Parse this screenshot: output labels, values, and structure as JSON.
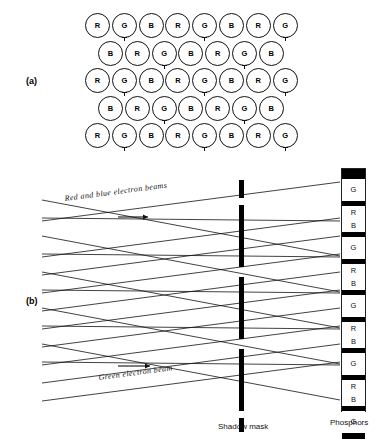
{
  "figure": {
    "part_a_label": "(a)",
    "part_b_label": "(b)"
  },
  "part_a": {
    "name": "phosphor-dot-triad-pattern",
    "row_count": 5,
    "rows": [
      {
        "offset": 0,
        "cells": [
          "R",
          "G",
          "B",
          "R",
          "G",
          "B",
          "R",
          "G"
        ],
        "marks": [
          1,
          4,
          7
        ]
      },
      {
        "offset": 13,
        "cells": [
          "B",
          "R",
          "G",
          "B",
          "R",
          "G",
          "B"
        ],
        "marks": [
          2,
          5
        ]
      },
      {
        "offset": 0,
        "cells": [
          "R",
          "G",
          "B",
          "R",
          "G",
          "B",
          "R",
          "G"
        ],
        "marks": [
          1,
          4,
          7
        ]
      },
      {
        "offset": 13,
        "cells": [
          "B",
          "R",
          "G",
          "B",
          "R",
          "G",
          "B"
        ],
        "marks": [
          2,
          5
        ]
      },
      {
        "offset": 0,
        "cells": [
          "R",
          "G",
          "B",
          "R",
          "G",
          "B",
          "R",
          "G"
        ],
        "marks": [
          1,
          4,
          7
        ]
      }
    ]
  },
  "part_b": {
    "beam_caption_red_blue": "Red and blue electron beams",
    "beam_caption_green": "Green electron beam",
    "shadow_mask_caption": "Shadow mask",
    "phosphors_caption": "Phosphors",
    "shadow_mask": {
      "name": "shadow-mask",
      "bars": [
        {
          "top": 20,
          "height": 18
        },
        {
          "top": 45,
          "height": 62
        },
        {
          "top": 117,
          "height": 62
        },
        {
          "top": 189,
          "height": 62
        },
        {
          "top": 258,
          "height": 14
        }
      ]
    },
    "phosphor_strip": {
      "name": "phosphor-strip",
      "bands": [
        {
          "type": "dark",
          "height": 10,
          "label": ""
        },
        {
          "type": "cell",
          "height": 22,
          "label": "G"
        },
        {
          "type": "dark",
          "height": 5,
          "label": ""
        },
        {
          "type": "cell",
          "height": 13,
          "label": "R"
        },
        {
          "type": "cell",
          "height": 13,
          "label": "B"
        },
        {
          "type": "dark",
          "height": 5,
          "label": ""
        },
        {
          "type": "cell",
          "height": 22,
          "label": "G"
        },
        {
          "type": "dark",
          "height": 5,
          "label": ""
        },
        {
          "type": "cell",
          "height": 13,
          "label": "R"
        },
        {
          "type": "cell",
          "height": 13,
          "label": "B"
        },
        {
          "type": "dark",
          "height": 5,
          "label": ""
        },
        {
          "type": "cell",
          "height": 22,
          "label": "G"
        },
        {
          "type": "dark",
          "height": 5,
          "label": ""
        },
        {
          "type": "cell",
          "height": 13,
          "label": "R"
        },
        {
          "type": "cell",
          "height": 13,
          "label": "B"
        },
        {
          "type": "dark",
          "height": 5,
          "label": ""
        },
        {
          "type": "cell",
          "height": 22,
          "label": "G"
        },
        {
          "type": "dark",
          "height": 5,
          "label": ""
        },
        {
          "type": "cell",
          "height": 13,
          "label": "R"
        },
        {
          "type": "cell",
          "height": 13,
          "label": "B"
        },
        {
          "type": "dark",
          "height": 5,
          "label": ""
        },
        {
          "type": "cell",
          "height": 22,
          "label": "G"
        },
        {
          "type": "dark",
          "height": 6,
          "label": ""
        }
      ]
    },
    "beam_group_a": {
      "name": "red-and-blue-electron-beams",
      "left_x": 42,
      "right_x": 340,
      "lines": [
        {
          "y0": 40,
          "y1": 96
        },
        {
          "y0": 58,
          "y1": 61
        },
        {
          "y0": 76,
          "y1": 132
        },
        {
          "y0": 94,
          "y1": 97
        },
        {
          "y0": 112,
          "y1": 168
        },
        {
          "y0": 130,
          "y1": 133
        },
        {
          "y0": 148,
          "y1": 204
        },
        {
          "y0": 166,
          "y1": 169
        },
        {
          "y0": 184,
          "y1": 240
        },
        {
          "y0": 202,
          "y1": 205
        }
      ]
    },
    "beam_group_b": {
      "name": "green-electron-beam",
      "left_x": 42,
      "right_x": 340,
      "lines": [
        {
          "y0": 61,
          "y1": 22
        },
        {
          "y0": 97,
          "y1": 58
        },
        {
          "y0": 115,
          "y1": 76
        },
        {
          "y0": 133,
          "y1": 94
        },
        {
          "y0": 151,
          "y1": 112
        },
        {
          "y0": 169,
          "y1": 130
        },
        {
          "y0": 187,
          "y1": 148
        },
        {
          "y0": 205,
          "y1": 166
        },
        {
          "y0": 223,
          "y1": 184
        },
        {
          "y0": 241,
          "y1": 202
        }
      ]
    },
    "arrows": [
      {
        "name": "beam-direction-arrow-upper",
        "x": 118,
        "y": 57,
        "len": 30
      },
      {
        "name": "beam-direction-arrow-lower",
        "x": 118,
        "y": 206,
        "len": 32
      }
    ]
  }
}
